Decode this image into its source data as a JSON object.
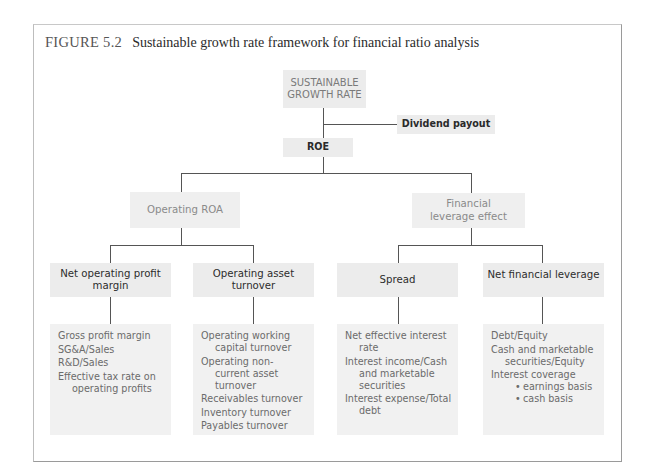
{
  "figure": {
    "label": "FIGURE 5.2",
    "title": "Sustainable growth rate framework for financial ratio analysis"
  },
  "nodes": {
    "sgr": "SUSTAINABLE GROWTH RATE",
    "dividend_payout": "Dividend payout",
    "roe": "ROE",
    "operating_roa": "Operating ROA",
    "financial_leverage_effect": "Financial leverage effect",
    "net_operating_profit_margin": "Net operating profit margin",
    "operating_asset_turnover": "Operating asset turnover",
    "spread": "Spread",
    "net_financial_leverage": "Net financial leverage"
  },
  "lists": {
    "margin_ratios": [
      "Gross profit margin",
      "SG&A/Sales",
      "R&D/Sales",
      "Effective tax rate on operating profits"
    ],
    "turnover_ratios": [
      "Operating working capital turnover",
      "Operating non-current asset turnover",
      "Receivables turnover",
      "Inventory turnover",
      "Payables turnover"
    ],
    "spread_ratios": [
      "Net effective interest rate",
      "Interest income/Cash and marketable securities",
      "Interest expense/Total debt"
    ],
    "leverage_ratios": {
      "items": [
        "Debt/Equity",
        "Cash and marketable securities/Equity",
        "Interest coverage"
      ],
      "interest_coverage_sub": [
        "earnings basis",
        "cash basis"
      ]
    }
  }
}
